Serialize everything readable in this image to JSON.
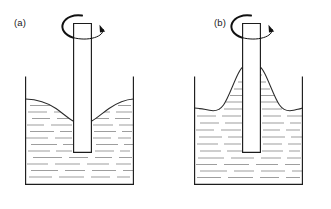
{
  "figure": {
    "background_color": "#ffffff",
    "line_color": "#1c1c1c",
    "hatch_color": "#8c8c8c",
    "arrow_color": "#111111",
    "width": 331,
    "height": 209
  },
  "panels": [
    {
      "id": "panel-a",
      "label": "(a)",
      "label_x": 14,
      "label_y": 26,
      "description": "Newtonian liquid: free surface dips down near the rotating rod forming a vortex depression.",
      "surface_shape": "dip",
      "tank": {
        "left": 25,
        "right": 134,
        "top": 77,
        "bottom": 185
      },
      "rod": {
        "left": 74,
        "right": 91,
        "top": 23,
        "bottom": 152
      },
      "surface_level": 99,
      "surface_extreme": 115,
      "rotation": {
        "direction": "clockwise",
        "label": "rotation"
      }
    },
    {
      "id": "panel-b",
      "label": "(b)",
      "label_x": 214,
      "label_y": 26,
      "description": "Viscoelastic liquid: free surface climbs up the rotating rod (Weissenberg effect).",
      "surface_shape": "climb",
      "tank": {
        "left": 194,
        "right": 303,
        "top": 77,
        "bottom": 185
      },
      "rod": {
        "left": 243,
        "right": 260,
        "top": 23,
        "bottom": 152
      },
      "surface_level": 108,
      "surface_extreme": 68,
      "rotation": {
        "direction": "clockwise",
        "label": "rotation"
      }
    }
  ],
  "legend": {
    "panel_a_caption": "(a)",
    "panel_b_caption": "(b)"
  }
}
